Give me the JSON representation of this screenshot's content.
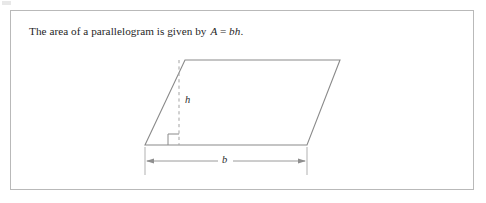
{
  "document": {
    "title": "The area of a parallelogram is given by A = bh."
  },
  "panel": {
    "border_color": "#b9b9b9",
    "background_color": "#ffffff"
  },
  "caption": {
    "lead_text": "The area of a parallelogram is given by",
    "formula_left": "A",
    "formula_equals": "=",
    "formula_right": "bh",
    "formula_period": ".",
    "full_text": "The area of a parallelogram is given by A = bh."
  },
  "figure": {
    "name": "parallelogram-diagram",
    "shape": "parallelogram",
    "stroke_color": "#8a8a8a",
    "dashed_color": "#9e9e9e",
    "vertices": {
      "top_left": [
        185,
        60
      ],
      "top_right": [
        340,
        60
      ],
      "bottom_right": [
        307,
        145
      ],
      "bottom_left": [
        145,
        145
      ]
    },
    "height_line": {
      "label": "h",
      "x": 179,
      "y_top": 60,
      "y_bottom": 145,
      "style": "dashed"
    },
    "right_angle_marker": {
      "label": "right-angle",
      "x": 168,
      "y": 134,
      "size": 11
    },
    "base_dimension": {
      "label": "b",
      "y": 161,
      "x_start": 145,
      "x_end": 307,
      "arrowheads": "both",
      "extension_line_top": 148,
      "extension_line_bottom": 174
    }
  }
}
